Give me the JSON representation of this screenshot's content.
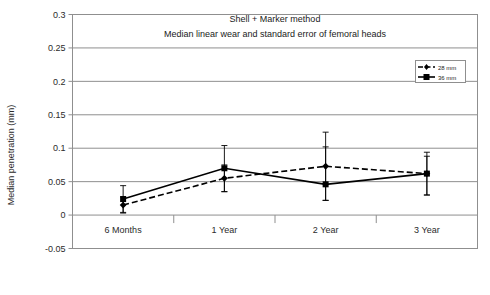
{
  "chart_data": {
    "type": "line",
    "title": "Shell + Marker method",
    "subtitle": "Median linear wear and standard error of femoral heads",
    "xlabel": "",
    "ylabel": "Median penetration (mm)",
    "categories": [
      "6 Months",
      "1 Year",
      "2 Year",
      "3 Year"
    ],
    "ylim": [
      -0.05,
      0.3
    ],
    "yticks": [
      "-0.05",
      "0",
      "0.05",
      "0.1",
      "0.15",
      "0.2",
      "0.25",
      "0.3"
    ],
    "ytick_values": [
      -0.05,
      0,
      0.05,
      0.1,
      0.15,
      0.2,
      0.25,
      0.3
    ],
    "grid": true,
    "legend_position": "top-right",
    "series": [
      {
        "name": "28 mm",
        "style": "dashed",
        "marker": "diamond",
        "color": "#000000",
        "values": [
          0.015,
          0.055,
          0.073,
          0.062
        ],
        "err_low": [
          0.003,
          0.035,
          0.022,
          0.03
        ],
        "err_high": [
          0.027,
          0.075,
          0.124,
          0.094
        ]
      },
      {
        "name": "36 mm",
        "style": "solid",
        "marker": "square",
        "color": "#000000",
        "values": [
          0.024,
          0.07,
          0.046,
          0.062
        ],
        "err_low": [
          0.004,
          0.035,
          0.022,
          0.03
        ],
        "err_high": [
          0.044,
          0.104,
          0.102,
          0.088
        ]
      }
    ]
  },
  "legend": {
    "items": [
      {
        "label": "28 mm"
      },
      {
        "label": "36 mm"
      }
    ]
  },
  "colors": {
    "line": "#000000",
    "grid": "#8f8f8f",
    "frame": "#8f8f8f",
    "text": "#1a1a1a"
  }
}
